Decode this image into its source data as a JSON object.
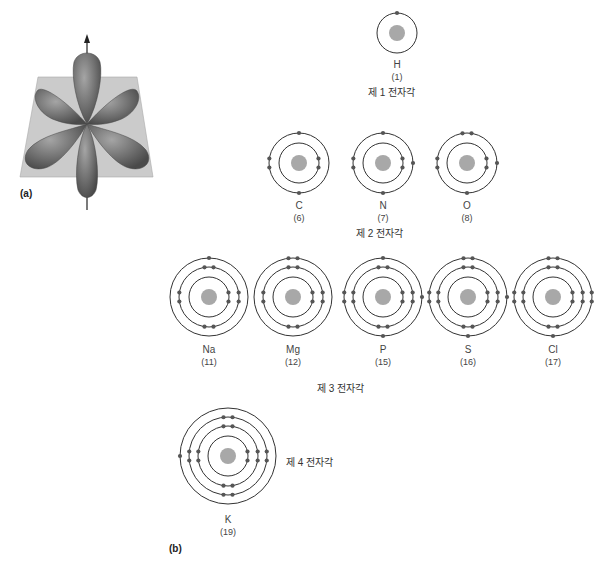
{
  "panel_a": {
    "label": "(a)",
    "description": "3D d-orbital (four lobes in a plane plus axial lobes) with vertical axis arrow",
    "colors": {
      "lobe": "#6e6e6e",
      "lobe_light": "#9a9a9a",
      "plane": "#c9c9c9",
      "axis": "#333333"
    }
  },
  "panel_b": {
    "label": "(b)",
    "shell_labels": {
      "shell1": "제 1 전자각",
      "shell2": "제 2 전자각",
      "shell3": "제 3 전자각",
      "shell4": "제 4 전자각"
    },
    "atoms": [
      {
        "symbol": "H",
        "atomic_number": "(1)",
        "shells": [
          1
        ]
      },
      {
        "symbol": "C",
        "atomic_number": "(6)",
        "shells": [
          2,
          4
        ]
      },
      {
        "symbol": "N",
        "atomic_number": "(7)",
        "shells": [
          2,
          5
        ]
      },
      {
        "symbol": "O",
        "atomic_number": "(8)",
        "shells": [
          2,
          6
        ]
      },
      {
        "symbol": "Na",
        "atomic_number": "(11)",
        "shells": [
          2,
          8,
          1
        ]
      },
      {
        "symbol": "Mg",
        "atomic_number": "(12)",
        "shells": [
          2,
          8,
          2
        ]
      },
      {
        "symbol": "P",
        "atomic_number": "(15)",
        "shells": [
          2,
          8,
          5
        ]
      },
      {
        "symbol": "S",
        "atomic_number": "(16)",
        "shells": [
          2,
          8,
          6
        ]
      },
      {
        "symbol": "Cl",
        "atomic_number": "(17)",
        "shells": [
          2,
          8,
          7
        ]
      },
      {
        "symbol": "K",
        "atomic_number": "(19)",
        "shells": [
          2,
          8,
          8,
          1
        ]
      }
    ],
    "colors": {
      "nucleus": "#a8a8a8",
      "orbit": "#333333",
      "electron": "#555555"
    }
  }
}
